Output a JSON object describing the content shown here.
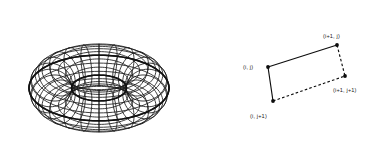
{
  "figure": {
    "background_color": "#ffffff",
    "ink_color": "#111111",
    "panels": [
      {
        "name": "torus-wireframe",
        "kind": "3d-wireframe-surface",
        "shape": "torus",
        "mesh": {
          "major_segments": 24,
          "minor_segments": 16,
          "major_radius": 87,
          "minor_radius": 38
        },
        "center": {
          "x": 99,
          "y": 88
        },
        "bounds": {
          "x": 12,
          "y": 18,
          "width": 174,
          "height": 142
        }
      },
      {
        "name": "quad-patch",
        "kind": "2d-quadrilateral",
        "bounds": {
          "x": 240,
          "y": 25,
          "width": 140,
          "height": 120
        },
        "vertices": [
          {
            "id": "i-j",
            "label": "(i, j)",
            "x": 268,
            "y": 67,
            "label_x": 243,
            "label_y": 69,
            "label_anchor": "start"
          },
          {
            "id": "i1-j",
            "label": "(i+1, j)",
            "x": 337,
            "y": 45,
            "label_x": 323,
            "label_y": 38,
            "label_anchor": "start"
          },
          {
            "id": "i1-j1",
            "label": "(i+1, j+1)",
            "x": 345,
            "y": 76,
            "label_x": 333,
            "label_y": 92,
            "label_anchor": "start"
          },
          {
            "id": "i-j1",
            "label": "(i, j+1)",
            "x": 273,
            "y": 101,
            "label_x": 250,
            "label_y": 118,
            "label_anchor": "start"
          }
        ],
        "edges": [
          {
            "id": "top-edge",
            "from": "i-j",
            "to": "i1-j",
            "style": "solid"
          },
          {
            "id": "left-edge",
            "from": "i-j",
            "to": "i-j1",
            "style": "solid"
          },
          {
            "id": "right-edge",
            "from": "i1-j",
            "to": "i1-j1",
            "style": "dashed"
          },
          {
            "id": "bottom-edge",
            "from": "i-j1",
            "to": "i1-j1",
            "style": "dashed"
          }
        ]
      }
    ]
  }
}
